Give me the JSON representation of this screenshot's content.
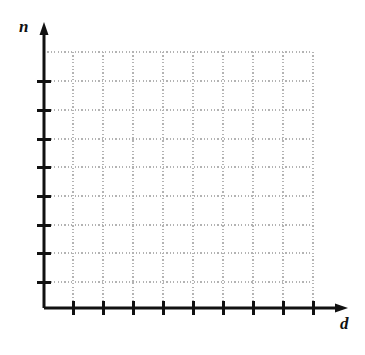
{
  "figure": {
    "type": "blank-coordinate-grid",
    "background_color": "#ffffff",
    "axis_color": "#111111",
    "grid_color": "#b3b3b3",
    "tick_color": "#111111"
  },
  "axes": {
    "y": {
      "label": "n",
      "label_style": "italic-serif",
      "line_x": 44,
      "line_top_y": 22,
      "line_bottom_y": 308,
      "arrow": "up",
      "tick_count": 8,
      "tick_positions": [
        81,
        110,
        139,
        167,
        196,
        225,
        253,
        282
      ],
      "tick_labels": [],
      "tick_half_length": 7
    },
    "x": {
      "label": "d",
      "label_style": "italic-serif",
      "line_y": 308,
      "line_left_x": 44,
      "line_right_x": 348,
      "arrow": "right",
      "tick_count": 9,
      "tick_positions": [
        73,
        103,
        133,
        163,
        193,
        223,
        253,
        283,
        313
      ],
      "tick_labels": [],
      "tick_half_length": 7
    }
  },
  "chart_data": {
    "type": "scatter",
    "title": "",
    "subtitle": "",
    "xlabel": "d",
    "ylabel": "n",
    "series": [],
    "x": [],
    "values": [],
    "grid": true,
    "grid_style": "dotted",
    "legend": "none",
    "xtick_labels": [],
    "ytick_labels": [],
    "xlim": [
      0,
      9
    ],
    "ylim": [
      0,
      9
    ]
  },
  "grid": {
    "style": "dotted",
    "color": "#b3b3b3",
    "top_y": 52,
    "bottom_y": 308,
    "left_x": 44,
    "right_x": 313,
    "vertical_lines_x": [
      73,
      103,
      133,
      163,
      193,
      223,
      253,
      283,
      313
    ],
    "horizontal_lines_y": [
      52,
      81,
      110,
      139,
      167,
      196,
      225,
      253,
      282
    ]
  }
}
